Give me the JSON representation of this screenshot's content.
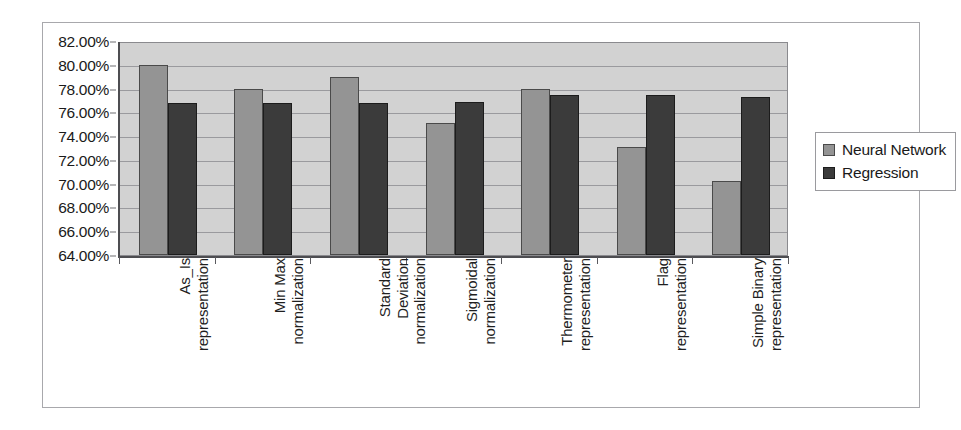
{
  "chart_data": {
    "type": "bar",
    "title": "",
    "subtitle": "",
    "xlabel": "",
    "ylabel": "",
    "ylim": [
      64,
      82
    ],
    "ytick_step": 2,
    "ytick_labels": [
      "82.00%",
      "80.00%",
      "78.00%",
      "76.00%",
      "74.00%",
      "72.00%",
      "70.00%",
      "68.00%",
      "66.00%",
      "64.00%"
    ],
    "ytick_values": [
      82,
      80,
      78,
      76,
      74,
      72,
      70,
      68,
      66,
      64
    ],
    "grid": true,
    "legend_position": "right",
    "categories": [
      "As_Is representation",
      "Min Max normalization",
      "Standard Deviation normalization",
      "Sigmoidal normalization",
      "Thermometer representation",
      "Flag representation",
      "Simple Binary representation"
    ],
    "category_lines": [
      [
        "As_Is",
        "representation"
      ],
      [
        "Min Max",
        "normalization"
      ],
      [
        "Standard",
        "Deviation",
        "normalization"
      ],
      [
        "Sigmoidal",
        "normalization"
      ],
      [
        "Thermometer",
        "representation"
      ],
      [
        "Flag",
        "representation"
      ],
      [
        "Simple Binary",
        "representation"
      ]
    ],
    "series": [
      {
        "name": "Neural Network",
        "color": "#949494",
        "values": [
          80.0,
          78.0,
          79.0,
          75.1,
          78.0,
          73.1,
          70.2
        ]
      },
      {
        "name": "Regression",
        "color": "#3b3b3b",
        "values": [
          76.8,
          76.8,
          76.8,
          76.9,
          77.5,
          77.5,
          77.3
        ]
      }
    ]
  },
  "legend": {
    "items": [
      {
        "label": "Neural Network",
        "color": "#949494"
      },
      {
        "label": "Regression",
        "color": "#3b3b3b"
      }
    ]
  },
  "colors": {
    "plot_background": "#d2d2d2",
    "gridline": "#9a9a9e",
    "axis": "#4d4d51",
    "frame_border": "#a8a8ac",
    "page_background": "#ffffff",
    "text": "#1a1a1a"
  }
}
